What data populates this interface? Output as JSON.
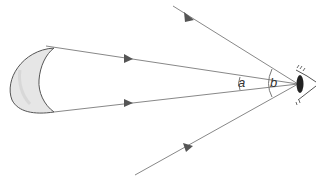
{
  "diagram": {
    "title": "",
    "colors": {
      "line": "#777777",
      "arrow": "#555555",
      "moon_fill": "#e6e6e6",
      "moon_stroke": "#555555",
      "eye": "#222222"
    },
    "objects": {
      "moon": {
        "shape": "crescent"
      },
      "eye": {
        "shape": "eye-side-view"
      }
    },
    "rays": [
      {
        "name": "moon-top-ray",
        "direction": "moon-to-eye"
      },
      {
        "name": "moon-bottom-ray",
        "direction": "moon-to-eye"
      },
      {
        "name": "upper-outer-ray",
        "direction": "to-eye"
      },
      {
        "name": "lower-outer-ray",
        "direction": "to-eye"
      }
    ],
    "angles": {
      "a": {
        "label": "a"
      },
      "b": {
        "label": "b"
      }
    }
  }
}
